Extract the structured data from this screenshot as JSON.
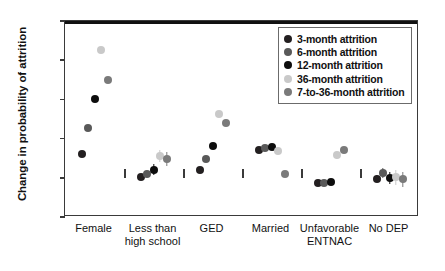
{
  "chart_data": {
    "type": "scatter",
    "title": "",
    "xlabel": "",
    "ylabel": "Change in probability of attrition",
    "ylim": [
      -0.05,
      0.2
    ],
    "yticks": [
      0.2,
      0.15,
      0.1,
      0.05,
      0,
      -0.05
    ],
    "ytick_labels": [
      "0.20",
      "0.15",
      "0.10",
      "0.05",
      "0",
      "−0.05"
    ],
    "grid": false,
    "legend_position": "top-right",
    "zero_reference_line": 0,
    "categories": [
      "Female",
      "Less than\nhigh school",
      "GED",
      "Married",
      "Unfavorable\nENTNAC",
      "No DEP"
    ],
    "series": [
      {
        "name": "3-month attrition",
        "color": "#231f20",
        "values": [
          0.03,
          0.001,
          0.01,
          0.0355,
          -0.006,
          -0.001
        ],
        "errors": [
          0.0,
          0.003,
          0.0,
          0.0,
          0.003,
          0.004
        ]
      },
      {
        "name": "6-month attrition",
        "color": "#595959",
        "values": [
          0.0635,
          0.005,
          0.0235,
          0.0375,
          -0.0065,
          0.006
        ],
        "errors": [
          0.0,
          0.004,
          0.0,
          0.0,
          0.003,
          0.006
        ]
      },
      {
        "name": "12-month attrition",
        "color": "#0d0d0d",
        "values": [
          0.1005,
          0.0105,
          0.04,
          0.039,
          -0.0055,
          0.0
        ],
        "errors": [
          0.0,
          0.007,
          0.0,
          0.0,
          0.003,
          0.008
        ]
      },
      {
        "name": "36-month attrition",
        "color": "#c9c9c9",
        "values": [
          0.1625,
          0.0275,
          0.0815,
          0.0345,
          0.0285,
          0.0005
        ],
        "errors": [
          0.0,
          0.008,
          0.0,
          0.0,
          0.004,
          0.01
        ]
      },
      {
        "name": "7-to-36-month attrition",
        "color": "#7a7a7a",
        "values": [
          0.1245,
          0.024,
          0.0705,
          0.005,
          0.0355,
          -0.002
        ],
        "errors": [
          0.0,
          0.009,
          0.0,
          0.0,
          0.004,
          0.01
        ]
      }
    ]
  },
  "legend": {
    "items": [
      {
        "label": "3-month attrition",
        "color": "#231f20"
      },
      {
        "label": "6-month attrition",
        "color": "#595959"
      },
      {
        "label": "12-month attrition",
        "color": "#0d0d0d"
      },
      {
        "label": "36-month attrition",
        "color": "#c9c9c9"
      },
      {
        "label": "7-to-36-month attrition",
        "color": "#7a7a7a"
      }
    ]
  },
  "axes": {
    "y_title": "Change in probability of attrition",
    "y_tick_labels": [
      "0.20",
      "0.15",
      "0.10",
      "0.05",
      "0",
      "−0.05"
    ],
    "x_categories": [
      "Female",
      "Less than\nhigh school",
      "GED",
      "Married",
      "Unfavorable\nENTNAC",
      "No DEP"
    ]
  },
  "colors": {
    "axis": "#3a3a3a",
    "zero_line": "#111111",
    "background": "#ffffff",
    "text": "#111111"
  }
}
